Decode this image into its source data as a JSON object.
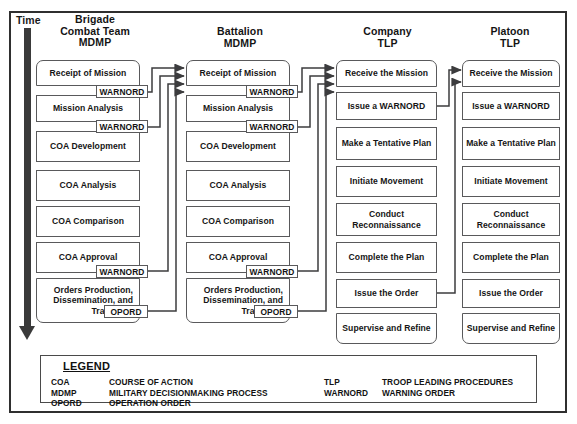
{
  "diagram": {
    "time_axis": {
      "label": "Time"
    },
    "columns": [
      {
        "id": "brigade",
        "header_lines": [
          "Brigade",
          "Combat Team",
          "MDMP"
        ],
        "steps": [
          "Receipt of Mission",
          "Mission Analysis",
          "COA Development",
          "COA Analysis",
          "COA Comparison",
          "COA Approval",
          "Orders Production, Dissemination, and Transition"
        ],
        "tags": [
          "WARNORD",
          "WARNORD",
          "WARNORD",
          "OPORD"
        ]
      },
      {
        "id": "battalion",
        "header_lines": [
          "Battalion",
          "MDMP"
        ],
        "steps": [
          "Receipt of Mission",
          "Mission Analysis",
          "COA Development",
          "COA Analysis",
          "COA Comparison",
          "COA Approval",
          "Orders Production, Dissemination, and Transition"
        ],
        "tags": [
          "WARNORD",
          "WARNORD",
          "WARNORD",
          "OPORD"
        ]
      },
      {
        "id": "company",
        "header_lines": [
          "Company",
          "TLP"
        ],
        "steps": [
          "Receive the Mission",
          "Issue a WARNORD",
          "Make a Tentative Plan",
          "Initiate Movement",
          "Conduct Reconnaissance",
          "Complete the Plan",
          "Issue the Order",
          "Supervise and Refine"
        ],
        "tags": []
      },
      {
        "id": "platoon",
        "header_lines": [
          "Platoon",
          "TLP"
        ],
        "steps": [
          "Receive the Mission",
          "Issue a WARNORD",
          "Make a Tentative Plan",
          "Initiate Movement",
          "Conduct Reconnaissance",
          "Complete the Plan",
          "Issue the Order",
          "Supervise and Refine"
        ],
        "tags": []
      }
    ]
  },
  "legend": {
    "title": "LEGEND",
    "left_entries": [
      {
        "abbr": "COA",
        "definition": "COURSE OF ACTION"
      },
      {
        "abbr": "MDMP",
        "definition": "MILITARY DECISIONMAKING PROCESS"
      },
      {
        "abbr": "OPORD",
        "definition": "OPERATION ORDER"
      }
    ],
    "right_entries": [
      {
        "abbr": "TLP",
        "definition": "TROOP LEADING PROCEDURES"
      },
      {
        "abbr": "WARNORD",
        "definition": "WARNING ORDER"
      }
    ]
  },
  "colors": {
    "line": "#59595b",
    "frame": "#2f2f2f",
    "time_arrow": "#3a3a3a",
    "text": "#151515",
    "background": "#ffffff"
  }
}
